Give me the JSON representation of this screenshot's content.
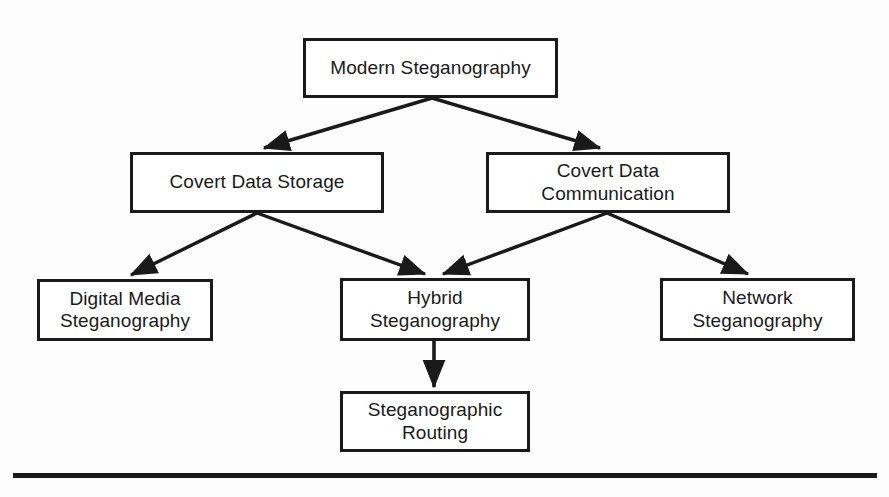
{
  "figure": {
    "kind": "hierarchy-tree-diagram",
    "width": 889,
    "height": 497,
    "background_color": "#fdfdfd",
    "line_color": "#1a1a1a",
    "text_color": "#1a1a1a"
  },
  "nodes": {
    "root": {
      "label": "Modern Steganography",
      "x": 303,
      "y": 38,
      "w": 255,
      "h": 60
    },
    "covert_storage": {
      "label": "Covert Data Storage",
      "x": 130,
      "y": 152,
      "w": 254,
      "h": 61
    },
    "covert_communication": {
      "label": "Covert Data\nCommunication",
      "x": 486,
      "y": 152,
      "w": 244,
      "h": 61
    },
    "digital_media": {
      "label": "Digital Media\nSteganography",
      "x": 37,
      "y": 279,
      "w": 176,
      "h": 62
    },
    "hybrid": {
      "label": "Hybrid\nSteganography",
      "x": 340,
      "y": 278,
      "w": 190,
      "h": 63
    },
    "network": {
      "label": "Network\nSteganography",
      "x": 660,
      "y": 278,
      "w": 195,
      "h": 63
    },
    "steg_routing": {
      "label": "Steganographic\nRouting",
      "x": 340,
      "y": 391,
      "w": 190,
      "h": 61
    }
  },
  "edges": [
    {
      "from": "root",
      "to": "covert_storage"
    },
    {
      "from": "root",
      "to": "covert_communication"
    },
    {
      "from": "covert_storage",
      "to": "digital_media"
    },
    {
      "from": "covert_storage",
      "to": "hybrid"
    },
    {
      "from": "covert_communication",
      "to": "hybrid"
    },
    {
      "from": "covert_communication",
      "to": "network"
    },
    {
      "from": "hybrid",
      "to": "steg_routing"
    }
  ],
  "footer_rule": {
    "x": 13,
    "y": 473,
    "w": 864,
    "h": 5
  }
}
